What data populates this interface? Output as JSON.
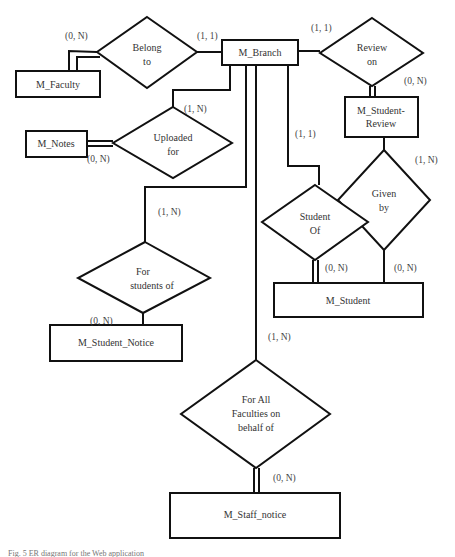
{
  "diagram": {
    "type": "entity-relationship",
    "entities": [
      {
        "id": "branch",
        "label": "M_Branch"
      },
      {
        "id": "faculty",
        "label": "M_Faculty"
      },
      {
        "id": "student_review",
        "label_line1": "M_Student-",
        "label_line2": "Review"
      },
      {
        "id": "notes",
        "label": "M_Notes"
      },
      {
        "id": "student",
        "label": "M_Student"
      },
      {
        "id": "student_notice",
        "label": "M_Student_Notice"
      },
      {
        "id": "staff_notice",
        "label": "M_Staff_notice"
      }
    ],
    "relationships": [
      {
        "id": "belong_to",
        "line1": "Belong",
        "line2": "to",
        "from": "M_Faculty",
        "to": "M_Branch",
        "card_from": "(0, N)",
        "card_to": "(1, 1)"
      },
      {
        "id": "review_on",
        "line1": "Review",
        "line2": "on",
        "from": "M_Branch",
        "to": "M_Student-Review",
        "card_from": "(1, 1)",
        "card_to": "(0, N)"
      },
      {
        "id": "uploaded_for",
        "line1": "Uploaded",
        "line2": "for",
        "from": "M_Notes",
        "to": "M_Branch",
        "card_from": "(0, N)",
        "card_to": "(1, N)"
      },
      {
        "id": "given_by",
        "line1": "Given",
        "line2": "by",
        "from": "M_Student-Review",
        "to": "M_Student",
        "card_from": "(1, N)",
        "card_to": "(0, N)"
      },
      {
        "id": "student_of",
        "line1": "Student",
        "line2": "Of",
        "from": "M_Branch",
        "to": "M_Student",
        "card_from": "(1, 1)",
        "card_to": "(0, N)"
      },
      {
        "id": "for_students_of",
        "line1": "For",
        "line2": "students of",
        "from": "M_Branch",
        "to": "M_Student_Notice",
        "card_from": "(1, N)",
        "card_to": "(0, N)"
      },
      {
        "id": "for_all_faculties",
        "line1": "For All",
        "line2": "Faculties on",
        "line3": "behalf of",
        "from": "M_Branch",
        "to": "M_Staff_notice",
        "card_from": "(1, N)",
        "card_to": "(0, N)"
      }
    ],
    "caption": "Fig. 5  ER diagram for the Web application"
  }
}
